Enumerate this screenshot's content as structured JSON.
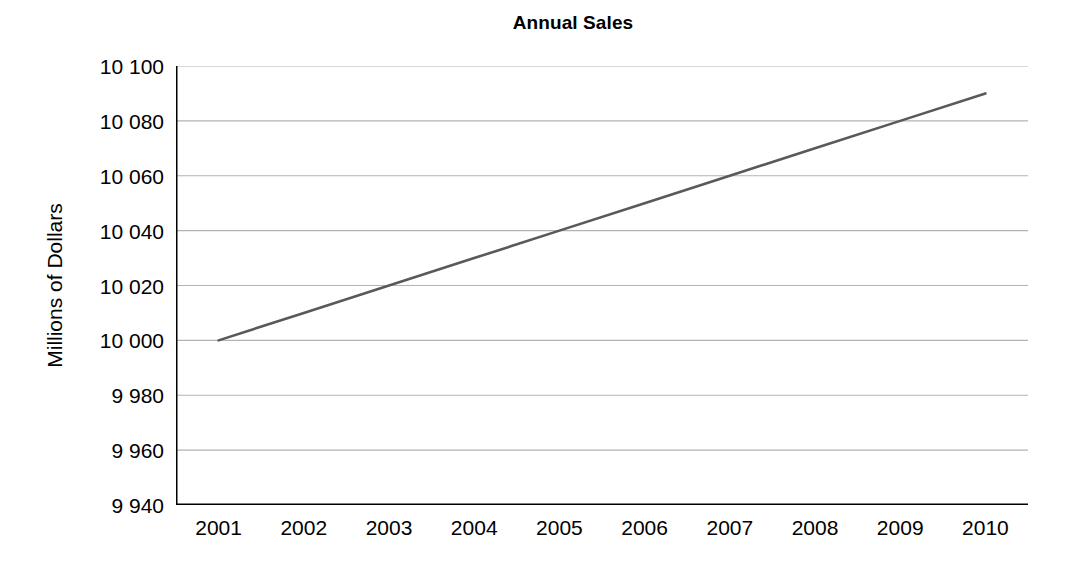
{
  "chart_data": {
    "type": "line",
    "title": "Annual Sales",
    "xlabel": "",
    "ylabel": "Millions of Dollars",
    "categories": [
      "2001",
      "2002",
      "2003",
      "2004",
      "2005",
      "2006",
      "2007",
      "2008",
      "2009",
      "2010"
    ],
    "values": [
      10000,
      10010,
      10020,
      10030,
      10040,
      10050,
      10060,
      10070,
      10080,
      10090
    ],
    "series": [
      {
        "name": "Annual Sales",
        "values": [
          10000,
          10010,
          10020,
          10030,
          10040,
          10050,
          10060,
          10070,
          10080,
          10090
        ]
      }
    ],
    "ylim": [
      9940,
      10100
    ],
    "ytick_step": 20,
    "ytick_values": [
      9940,
      9960,
      9980,
      10000,
      10020,
      10040,
      10060,
      10080,
      10100
    ],
    "ytick_labels": [
      "9 940",
      "9 960",
      "9 980",
      "10 000",
      "10 020",
      "10 040",
      "10 060",
      "10 080",
      "10 100"
    ],
    "grid": true,
    "grid_axis": "y",
    "legend": false,
    "legend_position": "none",
    "markers": false,
    "line_color": "#595959",
    "grid_color": "#b3b3b3",
    "axis_color": "#000000",
    "background_color": "#ffffff",
    "plot_background_color": "#ffffff"
  }
}
